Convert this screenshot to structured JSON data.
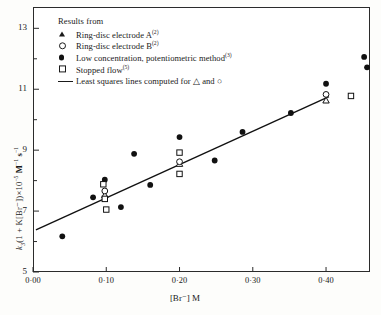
{
  "chart_data": {
    "type": "scatter",
    "title": "",
    "xlabel": "[Br⁻] M",
    "ylabel": "k₃(1 + K[Br⁻])×10⁻⁵ M⁻¹ s⁻¹",
    "xlim": [
      0.0,
      0.46
    ],
    "ylim": [
      5.0,
      13.7
    ],
    "xticks_major": [
      "0·00",
      "0·10",
      "0·20",
      "0·30",
      "0·40"
    ],
    "xtick_values": [
      0.0,
      0.1,
      0.2,
      0.3,
      0.4
    ],
    "yticks_major": [
      "13",
      "11",
      "9",
      "7",
      "5"
    ],
    "ytick_values": [
      13,
      11,
      9,
      7,
      5
    ],
    "ytick_minor_values": [
      12,
      10,
      8,
      6
    ],
    "grid": false,
    "legend_position": "top-left inside",
    "series": [
      {
        "name": "Ring-disc electrode A",
        "marker": "open-triangle",
        "footnote": "2",
        "points": [
          {
            "x": 0.098,
            "y": 7.52
          },
          {
            "x": 0.2,
            "y": 8.55
          },
          {
            "x": 0.4,
            "y": 10.63
          }
        ]
      },
      {
        "name": "Ring-disc electrode B",
        "marker": "open-circle",
        "footnote": "2",
        "points": [
          {
            "x": 0.098,
            "y": 7.66
          },
          {
            "x": 0.2,
            "y": 8.62
          },
          {
            "x": 0.4,
            "y": 10.83
          }
        ]
      },
      {
        "name": "Low concentration, potentiometric method",
        "marker": "filled-circle",
        "footnote": "3",
        "points": [
          {
            "x": 0.04,
            "y": 6.17
          },
          {
            "x": 0.082,
            "y": 7.45
          },
          {
            "x": 0.098,
            "y": 8.03
          },
          {
            "x": 0.12,
            "y": 7.13
          },
          {
            "x": 0.138,
            "y": 8.88
          },
          {
            "x": 0.16,
            "y": 7.86
          },
          {
            "x": 0.2,
            "y": 9.43
          },
          {
            "x": 0.248,
            "y": 8.66
          },
          {
            "x": 0.286,
            "y": 9.6
          },
          {
            "x": 0.352,
            "y": 10.22
          },
          {
            "x": 0.4,
            "y": 11.18
          },
          {
            "x": 0.452,
            "y": 12.06
          },
          {
            "x": 0.456,
            "y": 11.72
          }
        ]
      },
      {
        "name": "Stopped flow",
        "marker": "open-square",
        "footnote": "5",
        "points": [
          {
            "x": 0.096,
            "y": 7.88
          },
          {
            "x": 0.098,
            "y": 7.4
          },
          {
            "x": 0.1,
            "y": 7.05
          },
          {
            "x": 0.2,
            "y": 8.92
          },
          {
            "x": 0.2,
            "y": 8.22
          },
          {
            "x": 0.434,
            "y": 10.78
          }
        ]
      }
    ],
    "fit_line": {
      "name": "Least squares lines computed for △ and ○",
      "type": "line",
      "x_start": 0.004,
      "y_start": 6.38,
      "x_end": 0.404,
      "y_end": 10.76
    }
  },
  "legend": {
    "title": "Results from",
    "items": [
      {
        "symbol": "open-triangle",
        "label": "Ring-disc electrode A",
        "sup": "(2)"
      },
      {
        "symbol": "open-circle",
        "label": "Ring-disc electrode B",
        "sup": "(2)"
      },
      {
        "symbol": "filled-circle",
        "label": "Low concentration, potentiometric method",
        "sup": "(3)"
      },
      {
        "symbol": "open-square",
        "label": "Stopped flow",
        "sup": "(5)"
      },
      {
        "symbol": "line",
        "label": "Least squares lines computed for △ and ○",
        "sup": ""
      }
    ]
  },
  "axes": {
    "x_title": "[Br⁻] M",
    "y_title_parts": {
      "k": "k",
      "sub3": "3",
      "mid": "(1 + K[Br⁻])×10",
      "exp": "−5",
      "unit": " M",
      "unit_exp1": "−1",
      "unit_s": "s",
      "unit_exp2": "−1"
    }
  },
  "colors": {
    "axis": "#2b2b2b",
    "marker": "#111111",
    "background": "#ffffff",
    "page": "#fdfdfb"
  }
}
